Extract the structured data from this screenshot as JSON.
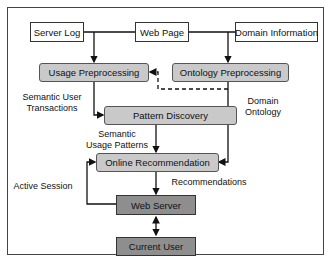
{
  "diagram": {
    "sources": {
      "server_log": "Server Log",
      "web_page": "Web Page",
      "domain_information": "Domain Information"
    },
    "processes": {
      "usage_preprocessing": "Usage Preprocessing",
      "ontology_preprocessing": "Ontology Preprocessing",
      "pattern_discovery": "Pattern Discovery",
      "online_recommendation": "Online Recommendation",
      "web_server": "Web Server",
      "current_user": "Current User"
    },
    "edge_labels": {
      "semantic_user_transactions_1": "Semantic User",
      "semantic_user_transactions_2": "Transactions",
      "domain_ontology_1": "Domain",
      "domain_ontology_2": "Ontology",
      "semantic_usage_patterns_1": "Semantic",
      "semantic_usage_patterns_2": "Usage Patterns",
      "recommendations": "Recommendations",
      "active_session": "Active Session"
    },
    "colors": {
      "process_fill": "#c9c9c9",
      "dark_fill": "#8e8e8e",
      "line": "#111111"
    }
  }
}
